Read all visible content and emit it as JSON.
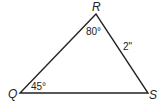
{
  "diagram": {
    "type": "triangle",
    "vertices": {
      "R": {
        "label": "R",
        "x": 96,
        "y": 14
      },
      "Q": {
        "label": "Q",
        "x": 20,
        "y": 93
      },
      "S": {
        "label": "S",
        "x": 148,
        "y": 93
      }
    },
    "angles": {
      "R": "80°",
      "Q": "45°"
    },
    "sides": {
      "RS": "2\""
    },
    "line_color": "#222222"
  }
}
